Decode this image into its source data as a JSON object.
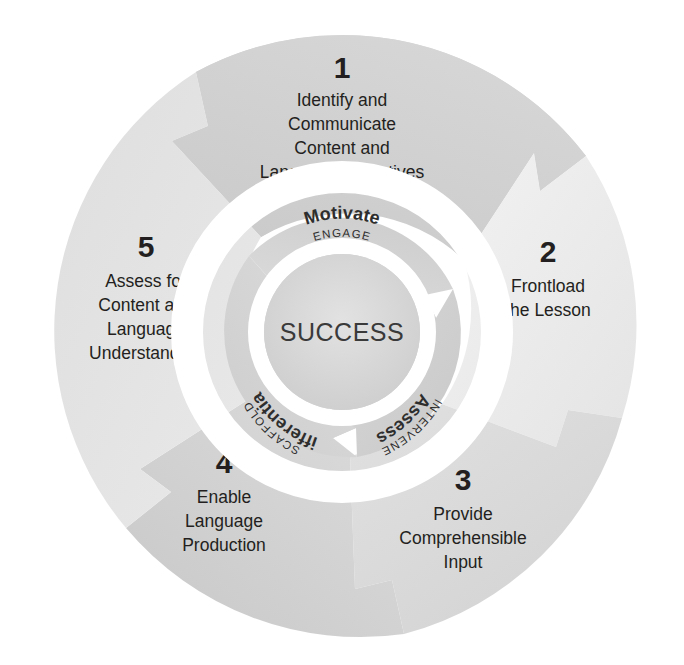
{
  "diagram": {
    "title": "Five-Step Instructional Cycle for Content and Language Success",
    "type": "cyclical-process-wheel",
    "center": {
      "label": "SUCCESS"
    },
    "colors": {
      "background": "#ffffff",
      "text_dark": "#231f20",
      "center_text": "#3a3a3a",
      "ring_gap": "#ffffff",
      "segment_1": "#cfcfcf",
      "segment_2": "#ededed",
      "segment_3": "#dcdcdc",
      "segment_4": "#d2d2d2",
      "segment_5": "#e6e6e6",
      "inner_ring_light": "#dfdfdf",
      "inner_ring_mid": "#d3d3d3",
      "center_disc": "#d8d8d8"
    },
    "outer_segments": [
      {
        "number": "1",
        "lines": [
          "Identify and",
          "Communicate",
          "Content and",
          "Language Objectives"
        ],
        "position": "top"
      },
      {
        "number": "2",
        "lines": [
          "Frontload",
          "the Lesson"
        ],
        "position": "right"
      },
      {
        "number": "3",
        "lines": [
          "Provide",
          "Comprehensible",
          "Input"
        ],
        "position": "bottom-right"
      },
      {
        "number": "4",
        "lines": [
          "Enable",
          "Language",
          "Production"
        ],
        "position": "bottom-left"
      },
      {
        "number": "5",
        "lines": [
          "Assess for",
          "Content and",
          "Language",
          "Understanding"
        ],
        "position": "left"
      }
    ],
    "inner_segments": [
      {
        "major": "Motivate",
        "minor": "ENGAGE",
        "position": "top"
      },
      {
        "major": "Assess",
        "minor": "INTERVENE",
        "position": "lower-right"
      },
      {
        "major": "Differentiate",
        "minor": "SCAFFOLD",
        "position": "lower-left"
      }
    ]
  }
}
